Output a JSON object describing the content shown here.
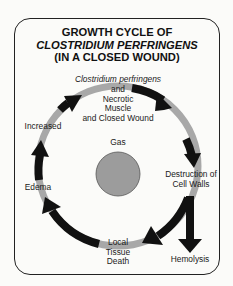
{
  "title": {
    "line1": "GROWTH CYCLE OF",
    "line2": "CLOSTRIDIUM PERFRINGENS",
    "line3": "(IN A CLOSED WOUND)"
  },
  "cycle": {
    "start": {
      "line1": "Clostridium perfringens",
      "line2": "and",
      "line3": "Necrotic",
      "line4": "Muscle",
      "line5": "and Closed Wound"
    },
    "center": "Gas",
    "destruction": {
      "line1": "Destruction of",
      "line2": "Cell Walls"
    },
    "hemolysis": "Hemolysis",
    "death": {
      "line1": "Local",
      "line2": "Tissue",
      "line3": "Death"
    },
    "edema": "Edema",
    "increased": "Increased"
  },
  "colors": {
    "ring": "#a8a8a8",
    "arrow": "#111111",
    "gas_fill": "#9c9c9c",
    "frame": "#222222"
  }
}
